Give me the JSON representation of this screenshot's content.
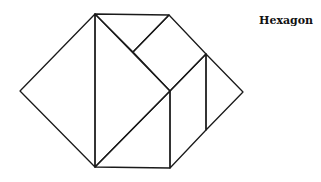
{
  "title": "Hexagon",
  "stroke_color": "#1a1a1a",
  "stroke_width": 1.3,
  "polygons": [
    {
      "name": "left-triangle",
      "points": "95,14 20,91 95,167"
    },
    {
      "name": "big-triangle",
      "points": "95,14 170,91 95,167"
    },
    {
      "name": "top-small-triangle",
      "points": "95,14 169,15 133,52"
    },
    {
      "name": "square",
      "points": "169,15 206,54 170,91 133,52"
    },
    {
      "name": "lower-triangle",
      "points": "95,167 170,91 170,168"
    },
    {
      "name": "parallelogram",
      "points": "170,91 206,54 206,130 170,168"
    },
    {
      "name": "right-triangle",
      "points": "206,54 243,92 206,130"
    }
  ]
}
